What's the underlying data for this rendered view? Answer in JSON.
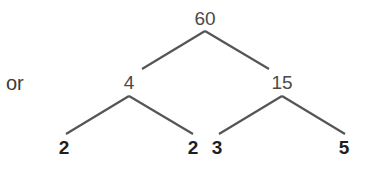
{
  "diagram": {
    "type": "factor-tree",
    "prefix_text": "or",
    "root": {
      "label": "60",
      "children": [
        {
          "label": "4",
          "children": [
            {
              "label": "2"
            },
            {
              "label": "2"
            }
          ]
        },
        {
          "label": "15",
          "children": [
            {
              "label": "3"
            },
            {
              "label": "5"
            }
          ]
        }
      ]
    },
    "colors": {
      "line": "#555555",
      "node_text": "#4a4a4a",
      "leaf_text": "#1f1f1f",
      "background": "#ffffff"
    }
  }
}
